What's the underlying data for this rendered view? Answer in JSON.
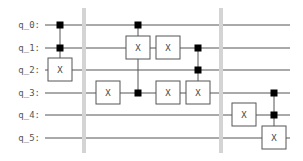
{
  "diagram": {
    "type": "quantum-circuit",
    "qubits": [
      {
        "label": "q_0:",
        "y": 25
      },
      {
        "label": "q_1:",
        "y": 48
      },
      {
        "label": "q_2:",
        "y": 70
      },
      {
        "label": "q_3:",
        "y": 93
      },
      {
        "label": "q_4:",
        "y": 115
      },
      {
        "label": "q_5:",
        "y": 138
      }
    ],
    "wire_start_x": 45,
    "wire_end_x": 290,
    "barriers": [
      {
        "x": 84,
        "y1": 8,
        "y2": 153
      },
      {
        "x": 221,
        "y1": 8,
        "y2": 153
      }
    ],
    "gates": [
      {
        "label": "X",
        "qubit": 2,
        "x": 60,
        "controls": [
          0,
          1
        ]
      },
      {
        "label": "X",
        "qubit": 3,
        "x": 108,
        "controls": []
      },
      {
        "label": "X",
        "qubit": 1,
        "x": 138,
        "controls": [
          0,
          3
        ]
      },
      {
        "label": "X",
        "qubit": 1,
        "x": 168,
        "controls": []
      },
      {
        "label": "X",
        "qubit": 3,
        "x": 168,
        "controls": []
      },
      {
        "label": "X",
        "qubit": 3,
        "x": 198,
        "controls": [
          1,
          2
        ]
      },
      {
        "label": "X",
        "qubit": 4,
        "x": 244,
        "controls": []
      },
      {
        "label": "X",
        "qubit": 5,
        "x": 274,
        "controls": [
          3,
          4
        ]
      }
    ],
    "colors": {
      "wire": "#555555",
      "gate_border": "#555555",
      "gate_fill": "#ffffff",
      "control": "#000000",
      "barrier": "#d4d4d4"
    }
  }
}
